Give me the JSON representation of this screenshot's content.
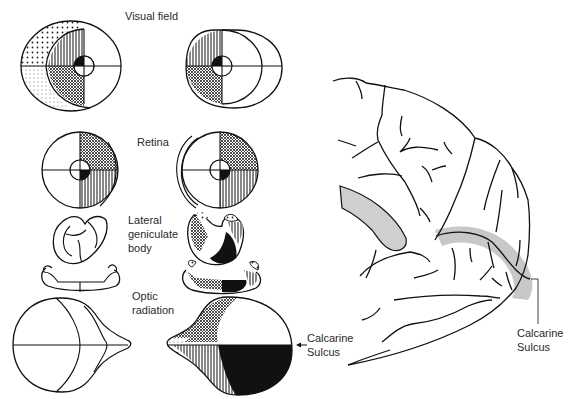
{
  "figure": {
    "labels": {
      "visual_field": "Visual field",
      "retina": "Retina",
      "lgb_line1": "Lateral",
      "lgb_line2": "geniculate",
      "lgb_line3": "body",
      "optic_line1": "Optic",
      "optic_line2": "radiation",
      "calcarine_mid_line1": "Calcarine",
      "calcarine_mid_line2": "Sulcus",
      "calcarine_right_line1": "Calcarine",
      "calcarine_right_line2": "Sulcus"
    },
    "stages": [
      "Visual field",
      "Retina",
      "Lateral geniculate body",
      "Optic radiation"
    ],
    "panels": {
      "left_column": "left eye / left hemisphere pathway (unshaded)",
      "right_column": "right pathway with shaded quadrants",
      "brain": "medial occipital lobe with calcarine sulcus highlighted"
    },
    "colors": {
      "ink": "#111111",
      "highlight_gray": "#c8c8c8",
      "label_text": "#2a2a2a"
    }
  }
}
